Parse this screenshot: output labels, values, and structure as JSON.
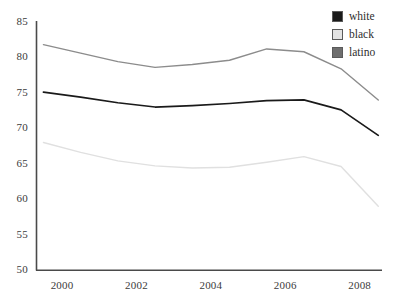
{
  "chart_data": {
    "type": "line",
    "title": "",
    "xlabel": "",
    "ylabel": "",
    "xlim": [
      1999.3,
      2008.6
    ],
    "ylim": [
      50,
      85
    ],
    "grid": false,
    "legend_position": "top-right",
    "x_ticks": [
      "2000",
      "2002",
      "2004",
      "2006",
      "2008"
    ],
    "x_tick_values": [
      2000,
      2002,
      2004,
      2006,
      2008
    ],
    "y_ticks": [
      "50",
      "55",
      "60",
      "65",
      "70",
      "75",
      "80",
      "85"
    ],
    "y_tick_values": [
      50,
      55,
      60,
      65,
      70,
      75,
      80,
      85
    ],
    "x": [
      1999.5,
      2000.5,
      2001.5,
      2002.5,
      2003.5,
      2004.5,
      2005.5,
      2006.5,
      2007.5,
      2008.5
    ],
    "series": [
      {
        "name": "white",
        "color": "#1a1a1a",
        "values": [
          75.1,
          74.4,
          73.6,
          73.0,
          73.2,
          73.5,
          73.9,
          74.0,
          72.6,
          69.0
        ]
      },
      {
        "name": "black",
        "color": "#e0e0e0",
        "values": [
          68.0,
          66.6,
          65.4,
          64.7,
          64.4,
          64.5,
          65.2,
          66.0,
          64.6,
          59.0
        ]
      },
      {
        "name": "latino",
        "color": "#8c8c8c",
        "values": [
          81.8,
          80.6,
          79.4,
          78.6,
          79.0,
          79.6,
          81.2,
          80.8,
          78.4,
          74.0
        ]
      }
    ]
  },
  "legend": {
    "items": [
      {
        "label": "white",
        "swatch_color": "#1a1a1a"
      },
      {
        "label": "black",
        "swatch_color": "#e3e3e3"
      },
      {
        "label": "latino",
        "swatch_color": "#6e6e6e"
      }
    ]
  },
  "axes": {
    "line_color": "#4a4a4a"
  }
}
